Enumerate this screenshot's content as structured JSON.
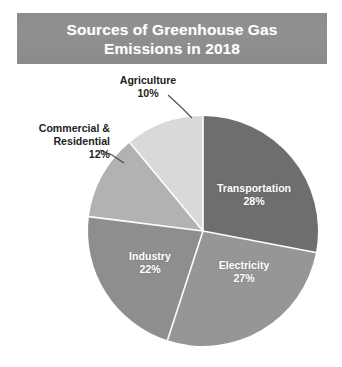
{
  "title": {
    "line1": "Sources of Greenhouse Gas",
    "line2": "Emissions in 2018",
    "full": "Sources of Greenhouse Gas\nEmissions in 2018",
    "banner_color": "#8d8d8d",
    "text_color": "#ffffff"
  },
  "labels": {
    "agriculture": "Agriculture\n10%",
    "commercial": "Commercial &\nResidential\n12%",
    "transportation": "Transportation\n28%",
    "electricity": "Electricity\n27%",
    "industry": "Industry\n22%"
  },
  "chart_data": {
    "type": "pie",
    "title": "Sources of Greenhouse Gas Emissions in 2018",
    "subtitle": "",
    "xlabel": "",
    "ylabel": "",
    "units": "percent",
    "total": 99,
    "start_angle_deg": 0,
    "direction": "clockwise",
    "legend": "none",
    "grid": false,
    "labels_inside": [
      "Transportation",
      "Electricity",
      "Industry"
    ],
    "labels_outside": [
      "Commercial & Residential",
      "Agriculture"
    ],
    "categories": [
      "Transportation",
      "Electricity",
      "Industry",
      "Commercial & Residential",
      "Agriculture"
    ],
    "values": [
      28,
      27,
      22,
      12,
      10
    ],
    "slices": [
      {
        "name": "Transportation",
        "value": 28,
        "value_label": "28%",
        "color": "#6e6e6e",
        "start_deg": 0,
        "end_deg": 100.8,
        "label_placement": "inside",
        "label_color": "#ffffff"
      },
      {
        "name": "Electricity",
        "value": 27,
        "value_label": "27%",
        "color": "#969696",
        "start_deg": 100.8,
        "end_deg": 198,
        "label_placement": "inside",
        "label_color": "#ffffff"
      },
      {
        "name": "Industry",
        "value": 22,
        "value_label": "22%",
        "color": "#8e8e8e",
        "start_deg": 198,
        "end_deg": 277.2,
        "label_placement": "inside",
        "label_color": "#ffffff"
      },
      {
        "name": "Commercial & Residential",
        "value": 12,
        "value_label": "12%",
        "color": "#b2b2b2",
        "start_deg": 277.2,
        "end_deg": 320.4,
        "label_placement": "outside",
        "label_color": "#231f20"
      },
      {
        "name": "Agriculture",
        "value": 10,
        "value_label": "10%",
        "color": "#d9d9d9",
        "start_deg": 320.4,
        "end_deg": 360,
        "label_placement": "outside",
        "label_color": "#231f20"
      }
    ],
    "geometry": {
      "center_x": 203,
      "center_y": 231,
      "radius": 115,
      "separator_color": "#ffffff"
    }
  }
}
